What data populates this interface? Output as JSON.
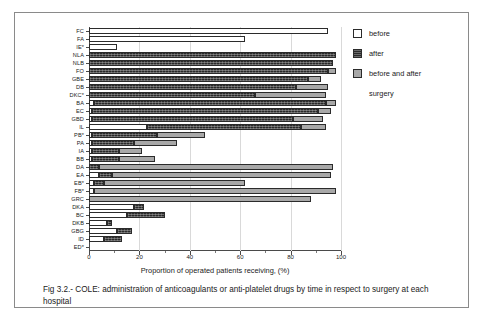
{
  "figure": {
    "caption": "Fig 3.2.-  COLE: administration of anticoagulants or anti-platelet drugs by time in respect to surgery at each hospital"
  },
  "legend": {
    "position": "top-right",
    "items": [
      {
        "label": "before",
        "color": "#ffffff",
        "key": "before"
      },
      {
        "label": "after",
        "color": "#2a2a2a",
        "key": "after"
      },
      {
        "label": "before and after",
        "color": "#a8a8a8",
        "key": "before_and_after"
      }
    ],
    "footnote": "surgery"
  },
  "chart_data": {
    "type": "bar",
    "orientation": "horizontal",
    "stacked": true,
    "title": "",
    "xlabel": "Proportion of operated patients receiving, (%)",
    "ylabel": "",
    "xlim": [
      0,
      100
    ],
    "xticks": [
      0,
      20,
      40,
      60,
      80,
      100
    ],
    "xticklabels": [
      "0",
      "20",
      "40",
      "60",
      "80",
      "100"
    ],
    "grid": "vertical",
    "categories": [
      "FC",
      "FA",
      "IE*",
      "NLA",
      "NLB",
      "FO",
      "GBE",
      "DB",
      "DKC*",
      "BA",
      "EC",
      "GBD",
      "IL",
      "PB*",
      "PA",
      "IA",
      "BB",
      "DA",
      "EA",
      "EB*",
      "FB*",
      "GRC",
      "DKA",
      "BC",
      "DKB",
      "GBG",
      "ID",
      "ED*"
    ],
    "series": [
      {
        "name": "before",
        "color": "#ffffff",
        "values": [
          95,
          62,
          11,
          0,
          0,
          0,
          0,
          0,
          0,
          2,
          1,
          1,
          23,
          1,
          1,
          1,
          1,
          0,
          4,
          2,
          2,
          0,
          18,
          15,
          7,
          11,
          6,
          0
        ]
      },
      {
        "name": "after",
        "color": "#2a2a2a",
        "values": [
          0,
          0,
          0,
          98,
          97,
          95,
          87,
          82,
          66,
          92,
          90,
          80,
          61,
          26,
          17,
          11,
          11,
          4,
          5,
          4,
          0,
          0,
          4,
          15,
          2,
          6,
          7,
          0
        ]
      },
      {
        "name": "before and after",
        "color": "#a8a8a8",
        "values": [
          0,
          0,
          0,
          0,
          0,
          3,
          5,
          13,
          28,
          4,
          5,
          12,
          10,
          19,
          17,
          9,
          14,
          93,
          87,
          56,
          96,
          88,
          0,
          0,
          0,
          0,
          0,
          0
        ]
      }
    ]
  }
}
